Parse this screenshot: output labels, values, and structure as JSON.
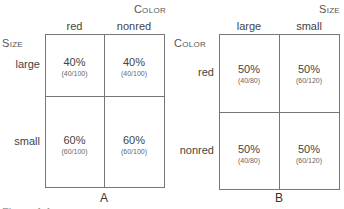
{
  "panel_a": {
    "label": "A",
    "column_variable": "Color",
    "row_variable": "Size",
    "columns": [
      "red",
      "nonred"
    ],
    "rows": [
      {
        "label": "large",
        "cells": [
          {
            "pct": "40%",
            "frac": "(40/100)"
          },
          {
            "pct": "40%",
            "frac": "(40/100)"
          }
        ]
      },
      {
        "label": "small",
        "cells": [
          {
            "pct": "60%",
            "frac": "(60/100)"
          },
          {
            "pct": "60%",
            "frac": "(60/100)"
          }
        ]
      }
    ]
  },
  "panel_b": {
    "label": "B",
    "column_variable": "Size",
    "row_variable": "Color",
    "columns": [
      "large",
      "small"
    ],
    "rows": [
      {
        "label": "red",
        "cells": [
          {
            "pct": "50%",
            "frac": "(40/80)"
          },
          {
            "pct": "50%",
            "frac": "(60/120)"
          }
        ]
      },
      {
        "label": "nonred",
        "cells": [
          {
            "pct": "50%",
            "frac": "(40/80)"
          },
          {
            "pct": "50%",
            "frac": "(60/120)"
          }
        ]
      }
    ]
  },
  "caption": "Figure 1.1"
}
